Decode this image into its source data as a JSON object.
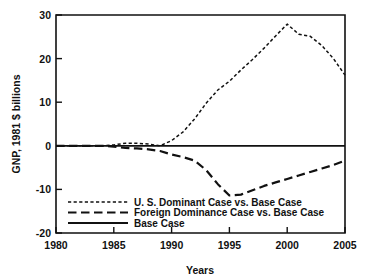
{
  "chart_data": {
    "type": "line",
    "title": "",
    "xlabel": "Years",
    "ylabel": "GNP, 1981 $ billions",
    "xlim": [
      1980,
      2005
    ],
    "ylim": [
      -20,
      30
    ],
    "xticks": [
      1980,
      1985,
      1990,
      1995,
      2000,
      2005
    ],
    "yticks": [
      30,
      20,
      10,
      0,
      -10,
      -20
    ],
    "xtick_labels": [
      "1980",
      "1985",
      "1990",
      "1995",
      "2000",
      "2005"
    ],
    "ytick_labels": [
      "30",
      "20",
      "10",
      "0",
      "-10",
      "-20"
    ],
    "grid": false,
    "legend_position": "lower-center",
    "zero_reference_line": true,
    "x": [
      1980,
      1981,
      1982,
      1983,
      1984,
      1985,
      1986,
      1987,
      1988,
      1989,
      1990,
      1991,
      1992,
      1993,
      1994,
      1995,
      1996,
      1997,
      1998,
      1999,
      2000,
      2001,
      2002,
      2003,
      2004,
      2005
    ],
    "series": [
      {
        "name": "U. S. Dominant Case vs. Base Case",
        "style": "dotted",
        "values": [
          0,
          0,
          0,
          0,
          0,
          0.2,
          0.6,
          0.6,
          0.4,
          0,
          1.2,
          3.2,
          6.2,
          9.8,
          12.8,
          14.8,
          17.4,
          19.8,
          22.4,
          25.2,
          27.9,
          25.6,
          25.1,
          23.0,
          20.0,
          16.2
        ]
      },
      {
        "name": "Foreign Dominance Case vs. Base Case",
        "style": "long-dash",
        "values": [
          0,
          0,
          0,
          0,
          0,
          -0.2,
          -0.5,
          -0.6,
          -0.8,
          -1.2,
          -2.0,
          -2.6,
          -3.4,
          -5.6,
          -8.8,
          -11.4,
          -11.2,
          -10.2,
          -9.2,
          -8.4,
          -7.6,
          -6.8,
          -6.0,
          -5.2,
          -4.4,
          -3.4
        ]
      },
      {
        "name": "Base Case",
        "style": "solid",
        "values": [
          0,
          0,
          0,
          0,
          0,
          0,
          0,
          0,
          0,
          0,
          0,
          0,
          0,
          0,
          0,
          0,
          0,
          0,
          0,
          0,
          0,
          0,
          0,
          0,
          0,
          0
        ]
      }
    ]
  },
  "legend": {
    "entries": [
      {
        "label": "U. S. Dominant Case vs. Base Case",
        "style": "dotted"
      },
      {
        "label": "Foreign Dominance Case vs. Base Case",
        "style": "long-dash"
      },
      {
        "label": "Base Case",
        "style": "solid"
      }
    ]
  },
  "colors": {
    "ink": "#111111",
    "background": "#ffffff"
  }
}
